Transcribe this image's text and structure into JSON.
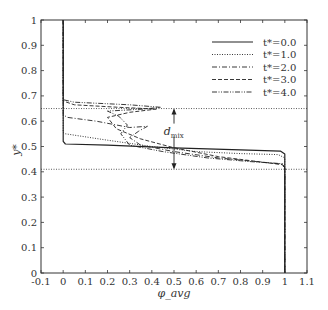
{
  "chart_data": {
    "type": "line",
    "title": "",
    "xlabel": "φ_avg",
    "ylabel": "y*",
    "xlim": [
      -0.1,
      1.1
    ],
    "ylim": [
      0,
      1
    ],
    "grid": false,
    "legend_position": "upper right",
    "x_ticks": [
      -0.1,
      0,
      0.1,
      0.2,
      0.3,
      0.4,
      0.5,
      0.6,
      0.7,
      0.8,
      0.9,
      1,
      1.1
    ],
    "x_tick_labels": [
      "-0.1",
      "0",
      "0.1",
      "0.2",
      "0.3",
      "0.4",
      "0.5",
      "0.6",
      "0.7",
      "0.8",
      "0.9",
      "1",
      "1.1"
    ],
    "y_ticks": [
      0,
      0.1,
      0.2,
      0.3,
      0.4,
      0.5,
      0.6,
      0.7,
      0.8,
      0.9,
      1
    ],
    "y_tick_labels": [
      "0",
      "0.1",
      "0.2",
      "0.3",
      "0.4",
      "0.5",
      "0.6",
      "0.7",
      "0.8",
      "0.9",
      "1"
    ],
    "series": [
      {
        "name": "t*=0.0",
        "style": "solid",
        "points": [
          [
            0,
            1
          ],
          [
            0,
            0.52
          ],
          [
            0.01,
            0.51
          ],
          [
            0.2,
            0.505
          ],
          [
            0.5,
            0.495
          ],
          [
            0.8,
            0.487
          ],
          [
            0.98,
            0.482
          ],
          [
            1.0,
            0.47
          ],
          [
            1.0,
            0
          ]
        ]
      },
      {
        "name": "t*=1.0",
        "style": "dotted",
        "points": [
          [
            0,
            1
          ],
          [
            0,
            0.555
          ],
          [
            0.01,
            0.55
          ],
          [
            0.2,
            0.525
          ],
          [
            0.4,
            0.5
          ],
          [
            0.6,
            0.48
          ],
          [
            0.8,
            0.472
          ],
          [
            0.97,
            0.468
          ],
          [
            1.0,
            0.455
          ],
          [
            1.0,
            0
          ]
        ]
      },
      {
        "name": "t*=2.0",
        "style": "dashdot",
        "points": [
          [
            0,
            1
          ],
          [
            0,
            0.625
          ],
          [
            0.02,
            0.615
          ],
          [
            0.15,
            0.6
          ],
          [
            0.3,
            0.575
          ],
          [
            0.38,
            0.58
          ],
          [
            0.34,
            0.56
          ],
          [
            0.3,
            0.535
          ],
          [
            0.35,
            0.505
          ],
          [
            0.5,
            0.48
          ],
          [
            0.7,
            0.455
          ],
          [
            0.9,
            0.438
          ],
          [
            0.99,
            0.43
          ],
          [
            1.0,
            0.415
          ],
          [
            1.0,
            0
          ]
        ]
      },
      {
        "name": "t*=3.0",
        "style": "dashed",
        "points": [
          [
            0,
            1
          ],
          [
            0,
            0.68
          ],
          [
            0.05,
            0.665
          ],
          [
            0.25,
            0.655
          ],
          [
            0.42,
            0.648
          ],
          [
            0.3,
            0.635
          ],
          [
            0.2,
            0.615
          ],
          [
            0.24,
            0.57
          ],
          [
            0.35,
            0.53
          ],
          [
            0.5,
            0.495
          ],
          [
            0.7,
            0.46
          ],
          [
            0.9,
            0.438
          ],
          [
            0.99,
            0.428
          ],
          [
            1.0,
            0.41
          ],
          [
            1.0,
            0
          ]
        ]
      },
      {
        "name": "t*=4.0",
        "style": "dashdotdot",
        "points": [
          [
            0,
            1
          ],
          [
            0,
            0.685
          ],
          [
            0.05,
            0.675
          ],
          [
            0.3,
            0.665
          ],
          [
            0.44,
            0.655
          ],
          [
            0.36,
            0.648
          ],
          [
            0.2,
            0.64
          ],
          [
            0.25,
            0.62
          ],
          [
            0.29,
            0.585
          ],
          [
            0.26,
            0.55
          ],
          [
            0.3,
            0.505
          ],
          [
            0.45,
            0.48
          ],
          [
            0.65,
            0.455
          ],
          [
            0.85,
            0.44
          ],
          [
            0.99,
            0.432
          ],
          [
            1.0,
            0.415
          ],
          [
            1.0,
            0
          ]
        ]
      }
    ],
    "reference_lines": [
      {
        "orientation": "horizontal",
        "y": 0.65,
        "style": "dotted"
      },
      {
        "orientation": "horizontal",
        "y": 0.41,
        "style": "dotted"
      }
    ],
    "annotations": [
      {
        "text": "d",
        "subscript": "mix",
        "x": 0.49,
        "y": 0.555,
        "arrow_from": 0.65,
        "arrow_to": 0.41,
        "arrow_x": 0.5
      }
    ]
  },
  "layout": {
    "plot_px": {
      "left": 41,
      "right": 307,
      "top": 20,
      "bottom": 273
    }
  }
}
